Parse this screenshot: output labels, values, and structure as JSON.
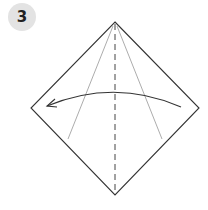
{
  "step": {
    "number": "3"
  },
  "diagram": {
    "colors": {
      "outline": "#333333",
      "crease": "#777777",
      "badge_bg": "#e3e3e3"
    },
    "icons": [
      "fold-arrow-icon"
    ]
  }
}
